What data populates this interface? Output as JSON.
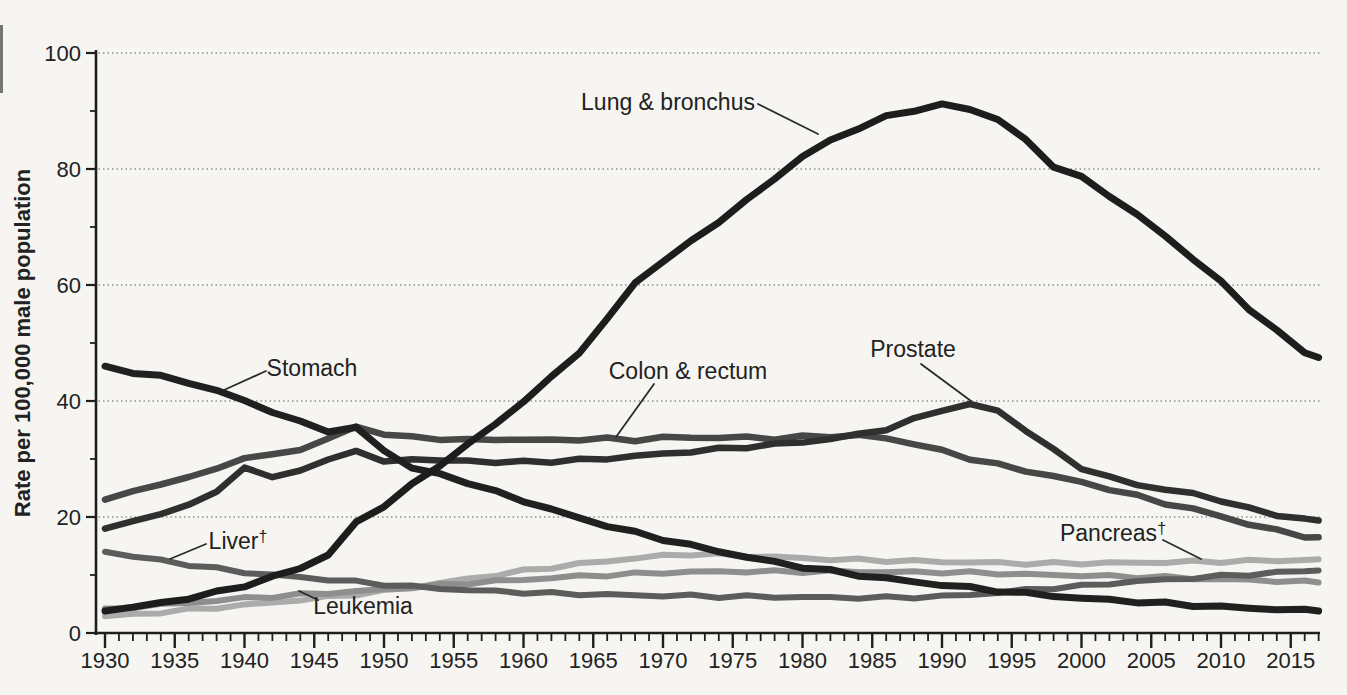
{
  "figure": {
    "background": "#f6f5f1",
    "axis_color": "#1e1e1e",
    "grid_color": "#8f8f8f",
    "text_color": "#222222",
    "callout_color": "#2a2a2a"
  },
  "y_axis": {
    "title": "Rate per 100,000 male population",
    "min": 0,
    "max": 100,
    "major_ticks": [
      0,
      20,
      40,
      60,
      80,
      100
    ],
    "minor_ticks": [
      10,
      30,
      50,
      70,
      90
    ]
  },
  "x_axis": {
    "min": 1930,
    "max": 2017,
    "labels": [
      "1930",
      "1935",
      "1940",
      "1945",
      "1950",
      "1955",
      "1960",
      "1965",
      "1970",
      "1975",
      "1980",
      "1985",
      "1990",
      "1995",
      "2000",
      "2005",
      "2010",
      "2015"
    ]
  },
  "chart_data": {
    "type": "line",
    "title": "",
    "xlabel": "",
    "ylabel": "Rate per 100,000 male population",
    "ylim": [
      0,
      100
    ],
    "xlim": [
      1930,
      2017
    ],
    "grid": "dotted-horizontal",
    "legend_position": "inline-annotations",
    "x": [
      1930,
      1932,
      1934,
      1936,
      1938,
      1940,
      1942,
      1944,
      1946,
      1948,
      1950,
      1952,
      1954,
      1956,
      1958,
      1960,
      1962,
      1964,
      1966,
      1968,
      1970,
      1972,
      1974,
      1976,
      1978,
      1980,
      1982,
      1984,
      1986,
      1988,
      1990,
      1992,
      1994,
      1996,
      1998,
      2000,
      2002,
      2004,
      2006,
      2008,
      2010,
      2012,
      2014,
      2016,
      2017
    ],
    "series": [
      {
        "id": "pancreas",
        "name": "Pancreas",
        "dagger": true,
        "color": "#ababab",
        "width": 6,
        "values": [
          2.9,
          3.2,
          3.6,
          4.0,
          4.4,
          4.8,
          5.3,
          5.7,
          6.2,
          6.7,
          7.2,
          7.9,
          8.6,
          9.3,
          10.0,
          10.7,
          11.3,
          11.9,
          12.4,
          12.9,
          13.3,
          13.6,
          13.5,
          13.3,
          13.1,
          12.9,
          12.7,
          12.6,
          12.5,
          12.4,
          12.3,
          12.2,
          12.1,
          12.0,
          12.0,
          12.0,
          12.1,
          12.1,
          12.2,
          12.3,
          12.3,
          12.4,
          12.5,
          12.6,
          12.7
        ],
        "label": {
          "text": "Pancreas",
          "x": 1113,
          "y": 541,
          "anchor": "middle"
        },
        "callout": {
          "x1": 1163,
          "y1": 540,
          "x2": 1201,
          "y2": 559
        }
      },
      {
        "id": "leukemia",
        "name": "Leukemia",
        "dagger": false,
        "color": "#8e8e8e",
        "width": 6,
        "values": [
          4.2,
          4.5,
          4.9,
          5.2,
          5.6,
          6.0,
          6.3,
          6.6,
          6.9,
          7.2,
          7.5,
          7.9,
          8.2,
          8.6,
          8.9,
          9.2,
          9.5,
          9.8,
          10.0,
          10.2,
          10.4,
          10.5,
          10.6,
          10.6,
          10.6,
          10.6,
          10.6,
          10.6,
          10.5,
          10.5,
          10.5,
          10.4,
          10.3,
          10.1,
          10.0,
          9.9,
          9.8,
          9.7,
          9.6,
          9.4,
          9.3,
          9.1,
          9.0,
          8.8,
          8.7
        ],
        "label": {
          "text": "Leukemia",
          "x": 363,
          "y": 614,
          "anchor": "middle"
        },
        "callout": {
          "x1": 318,
          "y1": 600,
          "x2": 299,
          "y2": 591
        }
      },
      {
        "id": "liver",
        "name": "Liver",
        "dagger": true,
        "color": "#5c5c5c",
        "width": 6,
        "values": [
          14.0,
          13.2,
          12.5,
          11.8,
          11.1,
          10.5,
          10.0,
          9.6,
          9.2,
          8.8,
          8.4,
          8.0,
          7.7,
          7.4,
          7.2,
          7.0,
          6.8,
          6.7,
          6.6,
          6.5,
          6.4,
          6.4,
          6.3,
          6.3,
          6.2,
          6.2,
          6.1,
          6.1,
          6.1,
          6.2,
          6.3,
          6.6,
          7.0,
          7.4,
          7.8,
          8.1,
          8.5,
          8.9,
          9.2,
          9.5,
          9.8,
          10.1,
          10.4,
          10.7,
          10.8
        ],
        "label": {
          "text": "Liver",
          "x": 238,
          "y": 549,
          "anchor": "middle"
        },
        "callout": {
          "x1": 206,
          "y1": 544,
          "x2": 170,
          "y2": 559
        }
      },
      {
        "id": "colon-rectum",
        "name": "Colon & rectum",
        "dagger": false,
        "color": "#474747",
        "width": 6.5,
        "values": [
          23.0,
          24.2,
          25.8,
          26.8,
          28.3,
          30.3,
          30.6,
          31.8,
          33.3,
          35.7,
          34.2,
          33.8,
          33.5,
          33.2,
          33.5,
          33.2,
          33.4,
          33.3,
          33.5,
          33.3,
          33.6,
          33.8,
          33.6,
          33.8,
          33.5,
          33.8,
          34.0,
          34.0,
          33.6,
          32.6,
          31.4,
          30.1,
          29.0,
          28.0,
          27.0,
          26.0,
          24.8,
          23.6,
          22.4,
          21.3,
          20.2,
          18.7,
          17.7,
          16.7,
          16.5
        ],
        "label": {
          "text": "Colon & rectum",
          "x": 688,
          "y": 379,
          "anchor": "middle"
        },
        "callout": {
          "x1": 654,
          "y1": 384,
          "x2": 616,
          "y2": 437
        }
      },
      {
        "id": "prostate",
        "name": "Prostate",
        "dagger": false,
        "color": "#2f2f2f",
        "width": 6.5,
        "values": [
          18.0,
          19.3,
          20.6,
          21.9,
          24.6,
          28.3,
          27.0,
          28.0,
          29.8,
          31.6,
          29.3,
          30.2,
          29.6,
          29.8,
          29.4,
          29.5,
          29.6,
          29.8,
          30.1,
          30.5,
          30.9,
          31.3,
          31.7,
          32.1,
          32.5,
          32.9,
          33.5,
          34.2,
          35.2,
          36.8,
          38.5,
          39.4,
          38.3,
          35.0,
          31.5,
          28.5,
          26.8,
          25.6,
          24.7,
          24.0,
          22.9,
          21.4,
          20.4,
          19.6,
          19.4
        ],
        "label": {
          "text": "Prostate",
          "x": 913,
          "y": 357,
          "anchor": "middle"
        },
        "callout": {
          "x1": 921,
          "y1": 364,
          "x2": 971,
          "y2": 401
        }
      },
      {
        "id": "stomach",
        "name": "Stomach",
        "dagger": false,
        "color": "#202020",
        "width": 7,
        "values": [
          46.0,
          45.0,
          44.2,
          43.2,
          41.8,
          40.0,
          38.2,
          36.3,
          34.9,
          35.3,
          31.5,
          28.5,
          27.3,
          26.0,
          24.3,
          22.8,
          21.3,
          19.8,
          18.5,
          17.3,
          16.2,
          15.1,
          14.1,
          13.1,
          12.2,
          11.4,
          10.7,
          10.0,
          9.4,
          8.8,
          8.3,
          7.8,
          7.3,
          6.8,
          6.4,
          6.0,
          5.7,
          5.4,
          5.1,
          4.8,
          4.5,
          4.3,
          4.1,
          3.9,
          3.8
        ],
        "label": {
          "text": "Stomach",
          "x": 312,
          "y": 376,
          "anchor": "middle"
        },
        "callout": {
          "x1": 266,
          "y1": 371,
          "x2": 224,
          "y2": 390
        }
      },
      {
        "id": "lung-bronchus",
        "name": "Lung & bronchus",
        "dagger": false,
        "color": "#1d1d1d",
        "width": 7,
        "values": [
          3.8,
          4.4,
          5.2,
          6.0,
          7.0,
          8.2,
          9.6,
          11.2,
          13.5,
          19.0,
          22.0,
          25.5,
          29.0,
          32.5,
          36.0,
          40.0,
          44.0,
          48.5,
          54.0,
          60.5,
          64.0,
          67.5,
          71.0,
          74.5,
          78.5,
          82.0,
          85.0,
          87.0,
          89.0,
          90.2,
          91.0,
          90.4,
          88.5,
          85.0,
          80.5,
          78.5,
          75.5,
          72.0,
          68.5,
          64.5,
          60.5,
          56.0,
          52.0,
          48.5,
          47.5
        ],
        "label": {
          "text": "Lung & bronchus",
          "x": 668,
          "y": 110,
          "anchor": "middle"
        },
        "callout": {
          "x1": 758,
          "y1": 104,
          "x2": 818,
          "y2": 134
        }
      }
    ]
  }
}
